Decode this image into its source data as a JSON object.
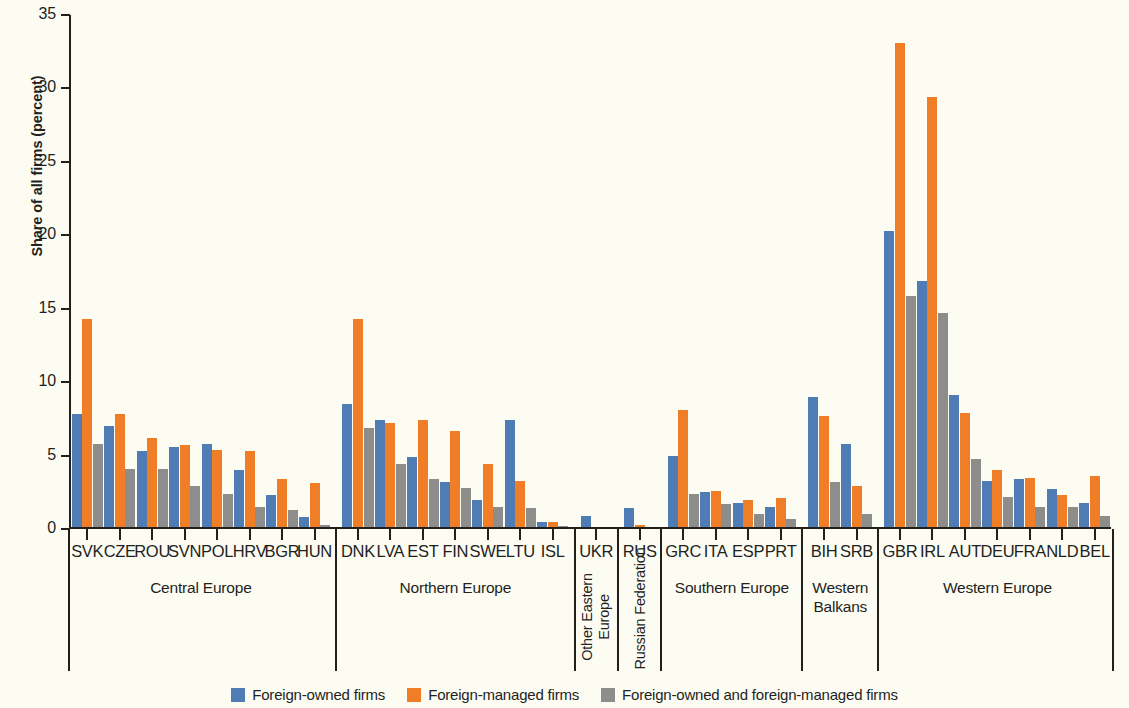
{
  "chart": {
    "type": "bar",
    "ylabel": "Share of all firms (percent)",
    "xlabel": "",
    "title": ""
  },
  "axis": {
    "yticks": [
      0,
      5,
      10,
      15,
      20,
      25,
      30,
      35
    ],
    "ylim": [
      0,
      35
    ]
  },
  "legend": {
    "position": "bottom",
    "items": [
      {
        "label": "Foreign-owned firms",
        "color": "#4f7cb4"
      },
      {
        "label": "Foreign-managed firms",
        "color": "#f07e26"
      },
      {
        "label": "Foreign-owned and foreign-managed firms",
        "color": "#8d8d8c"
      }
    ]
  },
  "chart_data": {
    "type": "bar",
    "title": "",
    "xlabel": "",
    "ylabel": "Share of all firms (percent)",
    "ylim": [
      0,
      35
    ],
    "yticks": [
      0,
      5,
      10,
      15,
      20,
      25,
      30,
      35
    ],
    "grid": false,
    "legend_position": "bottom",
    "categories": [
      "SVK",
      "CZE",
      "ROU",
      "SVN",
      "POL",
      "HRV",
      "BGR",
      "HUN",
      "DNK",
      "LVA",
      "EST",
      "FIN",
      "SWE",
      "LTU",
      "ISL",
      "UKR",
      "RUS",
      "GRC",
      "ITA",
      "ESP",
      "PRT",
      "BIH",
      "SRB",
      "GBR",
      "IRL",
      "AUT",
      "DEU",
      "FRA",
      "NLD",
      "BEL"
    ],
    "series": [
      {
        "name": "Foreign-owned firms",
        "color": "#4f7cb4",
        "values": [
          7.8,
          7.0,
          5.3,
          5.6,
          5.8,
          4.0,
          2.3,
          0.8,
          8.5,
          7.4,
          4.9,
          3.2,
          2.0,
          7.4,
          0.5,
          0.9,
          1.4,
          5.0,
          2.5,
          1.8,
          1.5,
          9.0,
          5.8,
          20.3,
          16.9,
          9.1,
          3.3,
          3.4,
          2.7,
          1.8
        ]
      },
      {
        "name": "Foreign-managed firms",
        "color": "#f07e26",
        "values": [
          14.3,
          7.8,
          6.2,
          5.7,
          5.4,
          5.3,
          3.4,
          3.1,
          14.3,
          7.2,
          7.4,
          6.7,
          4.4,
          3.3,
          0.45,
          0.1,
          0.3,
          8.1,
          2.6,
          2.0,
          2.1,
          7.7,
          2.9,
          33.1,
          29.4,
          7.9,
          4.0,
          3.5,
          2.3,
          3.6
        ]
      },
      {
        "name": "Foreign-owned and foreign-managed firms",
        "color": "#8d8d8c",
        "values": [
          5.8,
          4.1,
          4.1,
          2.9,
          2.4,
          1.5,
          1.3,
          0.3,
          6.9,
          4.4,
          3.4,
          2.8,
          1.5,
          1.4,
          0.2,
          0.0,
          0.05,
          2.4,
          1.7,
          1.0,
          0.7,
          3.2,
          1.0,
          15.9,
          14.7,
          4.8,
          2.2,
          1.5,
          1.5,
          0.9
        ]
      }
    ],
    "groups": [
      {
        "label": "Central Europe",
        "categories": [
          "SVK",
          "CZE",
          "ROU",
          "SVN",
          "POL",
          "HRV",
          "BGR",
          "HUN"
        ],
        "orientation": "horizontal"
      },
      {
        "label": "Northern Europe",
        "categories": [
          "DNK",
          "LVA",
          "EST",
          "FIN",
          "SWE",
          "LTU",
          "ISL"
        ],
        "orientation": "horizontal"
      },
      {
        "label": "Other Eastern Europe",
        "categories": [
          "UKR"
        ],
        "orientation": "vertical"
      },
      {
        "label": "Russian Federation",
        "categories": [
          "RUS"
        ],
        "orientation": "vertical"
      },
      {
        "label": "Southern Europe",
        "categories": [
          "GRC",
          "ITA",
          "ESP",
          "PRT"
        ],
        "orientation": "horizontal"
      },
      {
        "label": "Western Balkans",
        "categories": [
          "BIH",
          "SRB"
        ],
        "orientation": "horizontal"
      },
      {
        "label": "Western Europe",
        "categories": [
          "GBR",
          "IRL",
          "AUT",
          "DEU",
          "FRA",
          "NLD",
          "BEL"
        ],
        "orientation": "horizontal"
      }
    ]
  }
}
